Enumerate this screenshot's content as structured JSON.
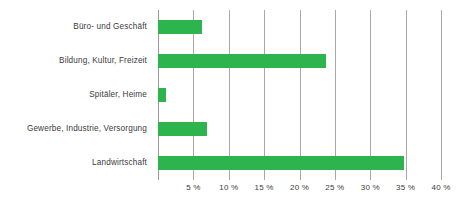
{
  "chart_data": {
    "type": "bar",
    "orientation": "horizontal",
    "title": "",
    "subtitle": "",
    "xlabel": "",
    "ylabel": "",
    "categories": [
      "Büro- und Geschäft",
      "Bildung, Kultur, Freizeit",
      "Spitäler, Heime",
      "Gewerbe, Industrie, Versorgung",
      "Landwirtschaft"
    ],
    "values": [
      6.2,
      23.7,
      1.1,
      6.9,
      34.7
    ],
    "value_unit": "%",
    "xlim": [
      0,
      40
    ],
    "xticks": [
      0,
      5,
      10,
      15,
      20,
      25,
      30,
      35,
      40
    ],
    "xtick_labels": [
      "",
      "5 %",
      "10 %",
      "15 %",
      "20 %",
      "25 %",
      "30 %",
      "35 %",
      "40 %"
    ],
    "grid": true,
    "legend": false,
    "series": [
      {
        "name": "Anteil",
        "color": "#2eb44c",
        "values": [
          6.2,
          23.7,
          1.1,
          6.9,
          34.7
        ]
      }
    ],
    "colors": {
      "bar": "#2eb44c",
      "gridline": "#a8a8a8",
      "axis": "#9a9a9a",
      "text": "#3b3b3b",
      "background": "#ffffff"
    }
  }
}
